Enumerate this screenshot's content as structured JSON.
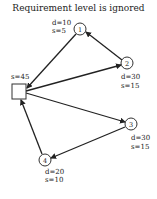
{
  "title": "Requirement level is ignored",
  "depot": {
    "label": "s=45",
    "x": 12,
    "y": 84,
    "w": 14,
    "h": 15
  },
  "nodes": [
    {
      "id": "1",
      "cx": 80,
      "cy": 29,
      "d": "d=10",
      "s": "s=5"
    },
    {
      "id": "2",
      "cx": 127,
      "cy": 63,
      "d": "d=30",
      "s": "s=15"
    },
    {
      "id": "3",
      "cx": 131,
      "cy": 124,
      "d": "d=30",
      "s": "s=15"
    },
    {
      "id": "4",
      "cx": 45,
      "cy": 160,
      "d": "d=20",
      "s": "s=10"
    }
  ],
  "edges": [
    {
      "from": "depot",
      "to": "2"
    },
    {
      "from": "2",
      "to": "1"
    },
    {
      "from": "1",
      "to": "depot"
    },
    {
      "from": "depot",
      "to": "3"
    },
    {
      "from": "3",
      "to": "4"
    },
    {
      "from": "4",
      "to": "depot"
    }
  ],
  "colors": {
    "stroke": "#222222",
    "background": "#ffffff"
  }
}
